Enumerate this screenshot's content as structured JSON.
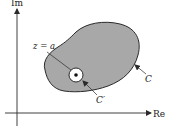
{
  "diagram": {
    "axes": {
      "x_label": "Re",
      "y_label": "Im"
    },
    "labels": {
      "point": "z = a",
      "inner_contour": "C′",
      "outer_contour": "C"
    },
    "colors": {
      "region_fill": "#a8a8a8",
      "stroke": "#2a2a2a",
      "background": "#ffffff"
    }
  }
}
